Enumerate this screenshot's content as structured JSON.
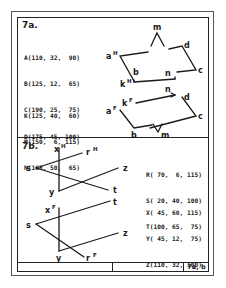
{
  "sheet": {
    "label": "7a, b"
  },
  "section_a": {
    "label": "7a.",
    "points_group1": [
      {
        "name": "A",
        "x": 110,
        "y": 32,
        "z": 90,
        "text": "A(110, 32,  90)"
      },
      {
        "name": "B",
        "x": 125,
        "y": 12,
        "z": 65,
        "text": "B(125, 12,  65)"
      },
      {
        "name": "C",
        "x": 190,
        "y": 25,
        "z": 75,
        "text": "C(190, 25,  75)"
      },
      {
        "name": "D",
        "x": 175,
        "y": 45,
        "z": 100,
        "text": "D(175, 45, 100)"
      }
    ],
    "points_group2": [
      {
        "name": "K",
        "x": 125,
        "y": 40,
        "z": 60,
        "text": "K(125, 40,  60)"
      },
      {
        "name": "M",
        "x": 150,
        "y": 6,
        "z": 115,
        "text": "M(150,  6, 115)"
      },
      {
        "name": "N",
        "x": 168,
        "y": 50,
        "z": 65,
        "text": "N(168, 50,  65)"
      }
    ],
    "horizontal_view_labels": {
      "a": "a",
      "a_sup": "H",
      "b": "b",
      "c": "c",
      "d": "d",
      "k": "k",
      "k_sup": "H",
      "m": "m",
      "n": "n"
    },
    "frontal_view_labels": {
      "a": "a",
      "a_sup": "F",
      "b": "b",
      "c": "c",
      "d": "d",
      "k": "k",
      "k_sup": "F",
      "m": "m",
      "n": "n"
    }
  },
  "section_b": {
    "label": "7b.",
    "points_group1": [
      {
        "name": "R",
        "x": 70,
        "y": 6,
        "z": 115,
        "text": "R( 70,  6, 115)"
      },
      {
        "name": "S",
        "x": 20,
        "y": 40,
        "z": 100,
        "text": "S( 20, 40, 100)"
      },
      {
        "name": "T",
        "x": 100,
        "y": 65,
        "z": 75,
        "text": "T(100, 65,  75)"
      }
    ],
    "points_group2": [
      {
        "name": "X",
        "x": 45,
        "y": 60,
        "z": 115,
        "text": "X( 45, 60, 115)"
      },
      {
        "name": "Y",
        "x": 45,
        "y": 12,
        "z": 75,
        "text": "Y( 45, 12,  75)"
      },
      {
        "name": "Z",
        "x": 110,
        "y": 32,
        "z": 100,
        "text": "Z(110, 32, 100)"
      }
    ],
    "horizontal_view_labels": {
      "x": "x",
      "x_sup": "H",
      "r": "r",
      "r_sup": "H",
      "s": "s",
      "z": "z",
      "y": "y",
      "t": "t"
    },
    "frontal_view_labels": {
      "x": "x",
      "x_sup": "F",
      "r": "r",
      "r_sup": "F",
      "s": "s",
      "z": "z",
      "y": "y",
      "t": "t"
    }
  }
}
